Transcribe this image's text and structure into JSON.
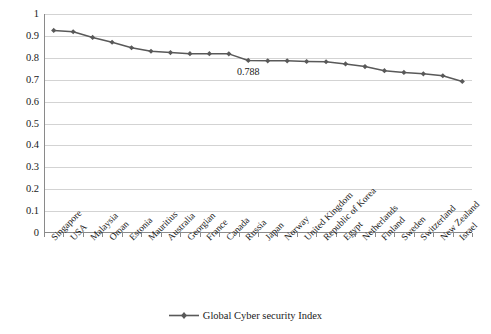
{
  "chart_data": {
    "type": "line",
    "title": "",
    "subtitle": "",
    "xlabel": "",
    "ylabel": "",
    "ylim": [
      0,
      1
    ],
    "ytick_labels": [
      "1",
      "0.9",
      "0.8",
      "0.7",
      "0.6",
      "0.5",
      "0.4",
      "0.3",
      "0.2",
      "0.1",
      "0"
    ],
    "ytick_values": [
      1,
      0.9,
      0.8,
      0.7,
      0.6,
      0.5,
      0.4,
      0.3,
      0.2,
      0.1,
      0
    ],
    "grid": true,
    "grid_axis": "y",
    "legend_position": "bottom-center",
    "series_color": "#595959",
    "grid_color": "#d3d3d3",
    "axis_color": "#8a8a8a",
    "marker": "diamond",
    "categories": [
      "Singapore",
      "USA",
      "Malaysia",
      "Oman",
      "Estonia",
      "Mauritius",
      "Australia",
      "Georgian",
      "France",
      "Canada",
      "Russia",
      "Japan",
      "Norway",
      "United Kingdom",
      "Republic of Korea",
      "Egypt",
      "Netherlands",
      "Finland",
      "Sweden",
      "Switzerland",
      "New Zealand",
      "Israel"
    ],
    "series": [
      {
        "name": "Global Cyber security Index",
        "values": [
          0.925,
          0.919,
          0.893,
          0.871,
          0.846,
          0.83,
          0.824,
          0.819,
          0.819,
          0.818,
          0.788,
          0.786,
          0.786,
          0.783,
          0.782,
          0.772,
          0.76,
          0.741,
          0.733,
          0.727,
          0.718,
          0.692
        ]
      }
    ],
    "annotations": [
      {
        "text": "0.788",
        "category": "Russia",
        "value": 0.788,
        "placement": "below"
      }
    ]
  },
  "legend": {
    "entries": [
      {
        "label": "Global Cyber security Index",
        "marker": "line-diamond-marker",
        "color": "#595959"
      }
    ]
  }
}
